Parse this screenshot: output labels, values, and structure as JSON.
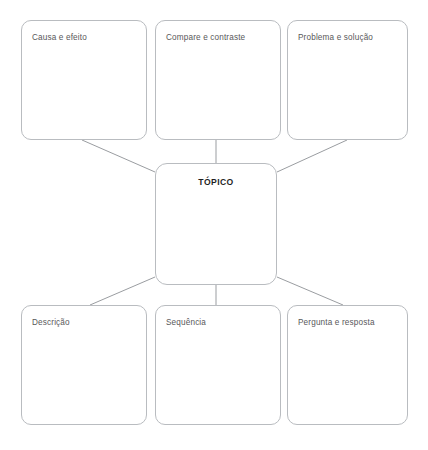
{
  "diagram": {
    "type": "concept-map",
    "center": {
      "id": "topic",
      "label": "TÓPICO"
    },
    "nodes": [
      {
        "id": "cause-effect",
        "label": "Causa e efeito",
        "row": "top",
        "column": 1
      },
      {
        "id": "compare-contrast",
        "label": "Compare e contraste",
        "row": "top",
        "column": 2
      },
      {
        "id": "problem-solution",
        "label": "Problema e solução",
        "row": "top",
        "column": 3
      },
      {
        "id": "description",
        "label": "Descrição",
        "row": "bottom",
        "column": 1
      },
      {
        "id": "sequence",
        "label": "Sequência",
        "row": "bottom",
        "column": 2
      },
      {
        "id": "question-answer",
        "label": "Pergunta e resposta",
        "row": "bottom",
        "column": 3
      }
    ],
    "connectors": [
      {
        "from": "cause-effect",
        "to": "topic",
        "style": "diagonal"
      },
      {
        "from": "compare-contrast",
        "to": "topic",
        "style": "vertical"
      },
      {
        "from": "problem-solution",
        "to": "topic",
        "style": "diagonal"
      },
      {
        "from": "topic",
        "to": "description",
        "style": "diagonal"
      },
      {
        "from": "topic",
        "to": "sequence",
        "style": "vertical"
      },
      {
        "from": "topic",
        "to": "question-answer",
        "style": "diagonal"
      }
    ],
    "colors": {
      "background": "#ffffff",
      "node_border": "#b9bcc0",
      "node_fill": "#ffffff",
      "label_text": "#58585a",
      "center_text": "#1f1f1f",
      "connector": "#9a9da1"
    }
  }
}
